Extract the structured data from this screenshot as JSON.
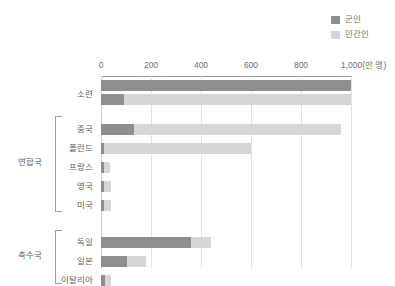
{
  "legend": {
    "position": "top-right",
    "items": [
      {
        "label": "군인",
        "color": "#8e8e8e",
        "icon": "legend-swatch-military"
      },
      {
        "label": "민간인",
        "color": "#d6d6d6",
        "icon": "legend-swatch-civilian"
      }
    ]
  },
  "axis": {
    "unit_label": "1,000(만 명)",
    "ticks": [
      {
        "value": 0,
        "label": "0"
      },
      {
        "value": 200,
        "label": "200"
      },
      {
        "value": 400,
        "label": "400"
      },
      {
        "value": 600,
        "label": "600"
      },
      {
        "value": 800,
        "label": "800"
      },
      {
        "value": 1000,
        "label": "1,000(만 명)"
      }
    ]
  },
  "groups": [
    {
      "name": "연합국",
      "label": "연합국",
      "members": [
        "중국",
        "폴란드",
        "프랑스",
        "영국",
        "미국"
      ]
    },
    {
      "name": "축수국",
      "label": "축수국",
      "members": [
        "독일",
        "일본",
        "이탈리아"
      ]
    }
  ],
  "chart_data": {
    "type": "bar",
    "orientation": "horizontal",
    "title": "",
    "xlabel": "1,000(만 명)",
    "ylabel": "",
    "xlim": [
      0,
      1000
    ],
    "grid": true,
    "legend_position": "top-right",
    "categories": [
      "소련",
      "중국",
      "폴란드",
      "프랑스",
      "영국",
      "미국",
      "독일",
      "일본",
      "이탈리아"
    ],
    "series": [
      {
        "name": "군인",
        "color": "#8e8e8e",
        "values": [
          1000,
          130,
          12,
          25,
          26,
          29,
          360,
          105,
          25
        ]
      },
      {
        "name": "민간인",
        "color": "#d6d6d6",
        "values": [
          1000,
          960,
          600,
          35,
          40,
          40,
          440,
          180,
          40
        ]
      }
    ]
  },
  "rows": [
    {
      "label": "소련",
      "bars": [
        {
          "military": 1000,
          "civilian": 0
        },
        {
          "military": 90,
          "civilian": 1000
        }
      ]
    },
    {
      "label": "중국",
      "bars": [
        {
          "military": 130,
          "civilian": 960
        }
      ]
    },
    {
      "label": "폴란드",
      "bars": [
        {
          "military": 12,
          "civilian": 600
        }
      ]
    },
    {
      "label": "프랑스",
      "bars": [
        {
          "military": 10,
          "civilian": 35
        }
      ]
    },
    {
      "label": "영국",
      "bars": [
        {
          "military": 10,
          "civilian": 40
        }
      ]
    },
    {
      "label": "미국",
      "bars": [
        {
          "military": 12,
          "civilian": 40
        }
      ]
    },
    {
      "label": "독일",
      "bars": [
        {
          "military": 360,
          "civilian": 440
        }
      ]
    },
    {
      "label": "일본",
      "bars": [
        {
          "military": 105,
          "civilian": 180
        }
      ]
    },
    {
      "label": "이탈리아",
      "bars": [
        {
          "military": 14,
          "civilian": 40
        }
      ]
    }
  ],
  "colors": {
    "military": "#8e8e8e",
    "civilian": "#d6d6d6",
    "grid": "#e3e3e3",
    "axis": "#9a9a9a",
    "text": "#5e5e5e"
  }
}
